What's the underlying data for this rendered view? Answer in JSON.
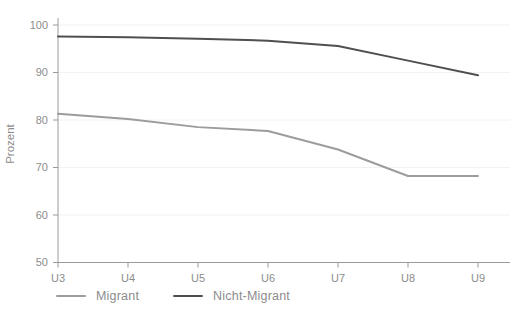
{
  "chart_data": {
    "type": "line",
    "title": "",
    "xlabel": "",
    "ylabel": "Prozent",
    "categories": [
      "U3",
      "U4",
      "U5",
      "U6",
      "U7",
      "U8",
      "U9"
    ],
    "series": [
      {
        "name": "Migrant",
        "color": "#9c9c9c",
        "values": [
          81.3,
          80.2,
          78.5,
          77.7,
          73.8,
          68.2,
          68.2
        ]
      },
      {
        "name": "Nicht-Migrant",
        "color": "#4f4f4f",
        "values": [
          97.6,
          97.4,
          97.1,
          96.7,
          95.6,
          92.5,
          89.4
        ]
      }
    ],
    "ylim": [
      50,
      100
    ],
    "yticks": [
      50,
      60,
      70,
      80,
      90,
      100
    ],
    "grid": true,
    "legend_position": "bottom-left"
  },
  "colors": {
    "axis": "#9a9a9a",
    "grid": "#f2f2f2",
    "tick_text": "#8c8c8c",
    "background": "#ffffff"
  }
}
